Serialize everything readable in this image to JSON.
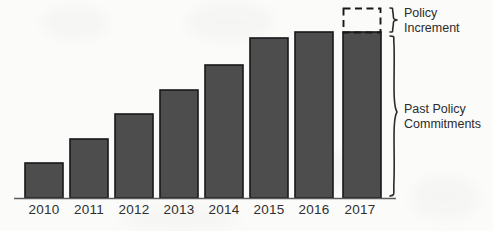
{
  "chart_data": {
    "type": "bar",
    "title": "",
    "subtitle": "",
    "xlabel": "",
    "ylabel": "",
    "grid": false,
    "legend_position": "right",
    "categories": [
      "2010",
      "2011",
      "2012",
      "2013",
      "2014",
      "2015",
      "2016",
      "2017"
    ],
    "series": [
      {
        "name": "Past Policy Commitments",
        "values": [
          35,
          59,
          84,
          108,
          133,
          160,
          166,
          166
        ]
      },
      {
        "name": "Policy Increment",
        "values": [
          0,
          0,
          0,
          0,
          0,
          0,
          0,
          24
        ],
        "style": "dashed-outline"
      }
    ],
    "ylim": [
      0,
      200
    ],
    "axis_labels_visible": true,
    "annotations": [
      {
        "name": "policy-increment",
        "label_line_1": "Policy",
        "label_line_2": "Increment",
        "brace": "small",
        "covers": "dashed segment of 2017 bar"
      },
      {
        "name": "past-policy-commitments",
        "label_line_1": "Past Policy",
        "label_line_2": "Commitments",
        "brace": "large",
        "covers": "solid body of 2017 bar"
      }
    ]
  },
  "style": {
    "bar_fill": "#4d4d4d",
    "bar_stroke": "#16181a",
    "background": "#fbfbfa",
    "text_color": "#2b2b2b",
    "axis_color": "#5c5c5c"
  },
  "geometry": {
    "baseline_y": 198,
    "bar_width": 38,
    "bar_pitch": 45,
    "first_bar_x": 25,
    "bar_tops": [
      163,
      139,
      114,
      90,
      65,
      38,
      32,
      32
    ],
    "dashed_top_2017": 8,
    "dashed_bottom_2017": 32
  }
}
